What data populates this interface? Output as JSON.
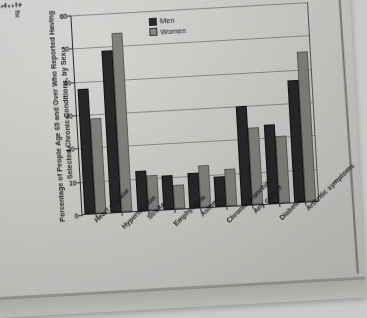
{
  "page": {
    "top_fragment": "adult...",
    "edge_fragment": "hed"
  },
  "chart_data": {
    "type": "bar",
    "title": "",
    "ylabel": "Percentage of People Age 65 and Over Who Reported Having Selected Chronic Conditions, by Sex",
    "xlabel": "",
    "ylim": [
      0,
      60
    ],
    "yticks": [
      0,
      10,
      20,
      30,
      40,
      50,
      60
    ],
    "grid": true,
    "legend_position": "top-center",
    "categories": [
      "Heart disease",
      "Hypertension",
      "Stroke",
      "Emphysema",
      "Asthma",
      "Chronic bronchitis",
      "Any cancer",
      "Diabetes",
      "Arthritic symptoms"
    ],
    "series": [
      {
        "name": "Men",
        "color": "#28282a",
        "values": [
          37,
          48,
          11.5,
          9.5,
          10,
          8.5,
          29,
          23,
          36
        ]
      },
      {
        "name": "Women",
        "color": "#84847f",
        "values": [
          28,
          53,
          10,
          6.5,
          12,
          10.5,
          22.5,
          19.5,
          44.5
        ]
      }
    ]
  }
}
